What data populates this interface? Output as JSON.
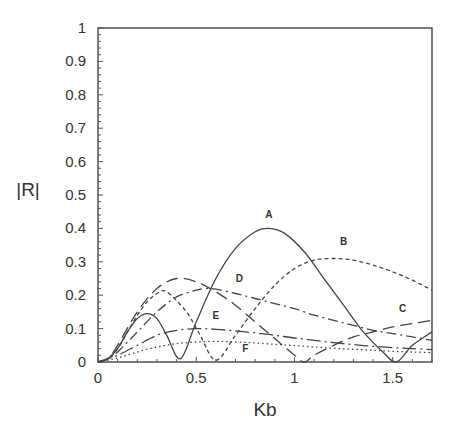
{
  "chart_data": {
    "type": "line",
    "title": "",
    "xlabel": "Kb",
    "ylabel": "|R|",
    "xlim": [
      0,
      1.7
    ],
    "ylim": [
      0,
      1
    ],
    "grid": false,
    "legend": "inline curve labels",
    "x_ticks": [
      "0",
      "0.5",
      "1",
      "1.5"
    ],
    "y_ticks": [
      "0",
      "0.1",
      "0.2",
      "0.3",
      "0.4",
      "0.5",
      "0.6",
      "0.7",
      "0.8",
      "0.9",
      "1"
    ],
    "series": [
      {
        "name": "A",
        "style": "solid",
        "x": [
          0,
          0.05,
          0.1,
          0.15,
          0.2,
          0.25,
          0.3,
          0.35,
          0.42,
          0.5,
          0.6,
          0.7,
          0.8,
          0.87,
          0.95,
          1.05,
          1.15,
          1.25,
          1.35,
          1.45,
          1.52,
          1.6,
          1.7
        ],
        "values": [
          0,
          0.01,
          0.04,
          0.09,
          0.13,
          0.145,
          0.13,
          0.08,
          0.01,
          0.12,
          0.25,
          0.34,
          0.39,
          0.4,
          0.385,
          0.33,
          0.25,
          0.17,
          0.09,
          0.03,
          0.0,
          0.05,
          0.09
        ]
      },
      {
        "name": "B",
        "style": "short-dash",
        "x": [
          0,
          0.05,
          0.1,
          0.15,
          0.2,
          0.25,
          0.3,
          0.35,
          0.45,
          0.52,
          0.6,
          0.7,
          0.8,
          0.9,
          1.0,
          1.1,
          1.2,
          1.3,
          1.4,
          1.5,
          1.6,
          1.7
        ],
        "values": [
          0,
          0.01,
          0.04,
          0.09,
          0.14,
          0.18,
          0.205,
          0.21,
          0.15,
          0.08,
          0.005,
          0.08,
          0.16,
          0.23,
          0.28,
          0.305,
          0.31,
          0.305,
          0.29,
          0.27,
          0.245,
          0.215
        ]
      },
      {
        "name": "C",
        "style": "long-dash",
        "x": [
          0,
          0.05,
          0.1,
          0.2,
          0.3,
          0.4,
          0.5,
          0.6,
          0.7,
          0.8,
          0.9,
          1.0,
          1.05,
          1.1,
          1.2,
          1.3,
          1.4,
          1.5,
          1.6,
          1.7
        ],
        "values": [
          0,
          0.01,
          0.05,
          0.15,
          0.22,
          0.25,
          0.24,
          0.21,
          0.17,
          0.12,
          0.07,
          0.02,
          0.0,
          0.02,
          0.05,
          0.075,
          0.09,
          0.105,
          0.115,
          0.125
        ]
      },
      {
        "name": "D",
        "style": "dash-dot",
        "x": [
          0,
          0.05,
          0.1,
          0.2,
          0.3,
          0.4,
          0.5,
          0.55,
          0.6,
          0.7,
          0.8,
          0.9,
          1.0,
          1.1,
          1.2,
          1.3,
          1.4,
          1.5,
          1.6,
          1.7
        ],
        "values": [
          0,
          0.01,
          0.03,
          0.09,
          0.15,
          0.195,
          0.215,
          0.22,
          0.218,
          0.205,
          0.19,
          0.175,
          0.16,
          0.14,
          0.125,
          0.11,
          0.095,
          0.085,
          0.075,
          0.065
        ]
      },
      {
        "name": "E",
        "style": "long-dash-dot",
        "x": [
          0,
          0.1,
          0.2,
          0.3,
          0.4,
          0.5,
          0.6,
          0.7,
          0.8,
          0.9,
          1.0,
          1.1,
          1.2,
          1.3,
          1.4,
          1.5,
          1.6,
          1.7
        ],
        "values": [
          0,
          0.02,
          0.05,
          0.08,
          0.095,
          0.1,
          0.098,
          0.093,
          0.087,
          0.08,
          0.072,
          0.065,
          0.058,
          0.052,
          0.047,
          0.043,
          0.04,
          0.037
        ]
      },
      {
        "name": "F",
        "style": "dotted",
        "x": [
          0,
          0.1,
          0.2,
          0.3,
          0.4,
          0.5,
          0.6,
          0.7,
          0.8,
          0.9,
          1.0,
          1.1,
          1.2,
          1.3,
          1.4,
          1.5,
          1.6,
          1.7
        ],
        "values": [
          0,
          0.012,
          0.03,
          0.045,
          0.055,
          0.06,
          0.062,
          0.06,
          0.057,
          0.053,
          0.049,
          0.045,
          0.041,
          0.038,
          0.035,
          0.032,
          0.03,
          0.028
        ]
      }
    ],
    "annotations": [
      {
        "text": "A",
        "x": 0.87,
        "y": 0.43
      },
      {
        "text": "B",
        "x": 1.25,
        "y": 0.35
      },
      {
        "text": "C",
        "x": 1.55,
        "y": 0.15
      },
      {
        "text": "D",
        "x": 0.72,
        "y": 0.24
      },
      {
        "text": "E",
        "x": 0.6,
        "y": 0.13
      },
      {
        "text": "F",
        "x": 0.75,
        "y": 0.03
      }
    ]
  }
}
